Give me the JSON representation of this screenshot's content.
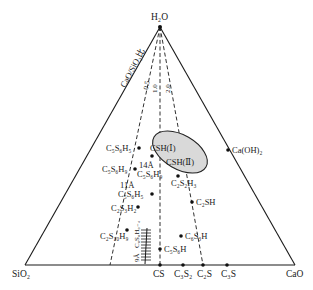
{
  "diagram": {
    "type": "ternary-phase-diagram",
    "vertices": {
      "top": "H₂O",
      "bottom_left": "SiO₂",
      "bottom_right": "CaO"
    },
    "ratio_axis": {
      "label": "CaO/SiO₂比",
      "ticks": [
        "0.5",
        "1.0",
        "2.0"
      ]
    },
    "regions": [
      {
        "label": "CSH(Ⅰ)"
      },
      {
        "label": "CSH(Ⅱ)"
      }
    ],
    "points": [
      {
        "label": "Ca(OH)₂"
      },
      {
        "label": "C₅S₆H₅"
      },
      {
        "label": "C₅S₆H₉"
      },
      {
        "label": "14Å"
      },
      {
        "label": "C₅S₆H₉"
      },
      {
        "label": "11Å"
      },
      {
        "label": "C₅S₆H₅"
      },
      {
        "label": "C₂S₃H₂"
      },
      {
        "label": "C₂S₁₀H₉"
      },
      {
        "label": "C₂S₂H₃"
      },
      {
        "label": "C₂SH"
      },
      {
        "label": "C₆S₃H"
      },
      {
        "label": "C₅S₆H"
      }
    ],
    "hatched_region": {
      "label": "C₆S₆H₀₋₄",
      "prefix": "9Å"
    },
    "base_axis_labels": [
      "CS",
      "C₃S₂",
      "C₂S",
      "C₃S"
    ],
    "colors": {
      "line": "#1a1a1a",
      "ellipse_fill": "#d9d9d9",
      "background": "#ffffff"
    }
  }
}
